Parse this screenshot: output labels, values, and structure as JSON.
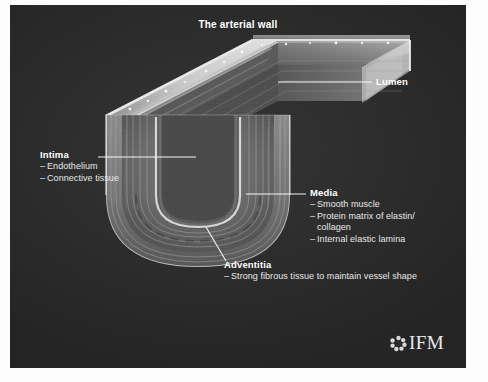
{
  "panel": {
    "background_color": "#2d2d2d",
    "text_color": "#f2f2f2"
  },
  "title": "The arterial wall",
  "annotations": [
    {
      "id": "lumen",
      "title": "Lumen",
      "items": []
    },
    {
      "id": "intima",
      "title": "Intima",
      "items": [
        "Endothelium",
        "Connective tissue"
      ]
    },
    {
      "id": "media",
      "title": "Media",
      "items": [
        "Smooth muscle",
        "Protein matrix of elastin/",
        "Internal elastic lamina"
      ],
      "continuation": "collagen"
    },
    {
      "id": "adventitia",
      "title": "Adventitia",
      "items": [
        "Strong fibrous tissue to maintain vessel shape"
      ]
    }
  ],
  "dash": "–",
  "logo": {
    "wordmark": "IFM",
    "mark": "rosette-icon"
  }
}
